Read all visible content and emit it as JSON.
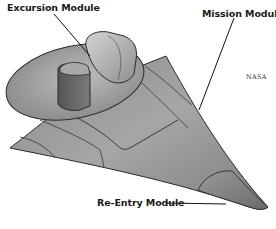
{
  "figure": {
    "labels": {
      "excursion": "Excursion Module",
      "mission": "Mission Module",
      "reentry": "Re-Entry Module"
    },
    "credit": "NASA"
  }
}
